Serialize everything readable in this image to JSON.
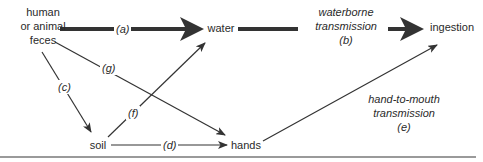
{
  "diagram": {
    "nodes": {
      "feces": {
        "lines": [
          "human",
          "or animal",
          "feces"
        ]
      },
      "water": {
        "label": "water"
      },
      "soil": {
        "label": "soil"
      },
      "hands": {
        "label": "hands"
      },
      "ingestion": {
        "label": "ingestion"
      }
    },
    "edges": {
      "a": {
        "label": "(a)",
        "from": "human or animal feces",
        "to": "water",
        "weight": "thick"
      },
      "b": {
        "lines": [
          "waterborne",
          "transmission",
          "(b)"
        ],
        "from": "water",
        "to": "ingestion",
        "weight": "thick"
      },
      "c": {
        "label": "(c)",
        "from": "human or animal feces",
        "to": "soil",
        "weight": "thin"
      },
      "d": {
        "label": "(d)",
        "from": "soil",
        "to": "hands",
        "weight": "thin"
      },
      "e": {
        "lines": [
          "hand-to-mouth",
          "transmission",
          "(e)"
        ],
        "from": "hands",
        "to": "ingestion",
        "weight": "thin"
      },
      "f": {
        "label": "(f)",
        "from": "soil",
        "to": "water",
        "weight": "thin"
      },
      "g": {
        "label": "(g)",
        "from": "human or animal feces",
        "to": "hands",
        "weight": "thin"
      }
    },
    "colors": {
      "line": "#333333",
      "text": "#2a2a2a",
      "rule": "#9a9a9a"
    }
  }
}
